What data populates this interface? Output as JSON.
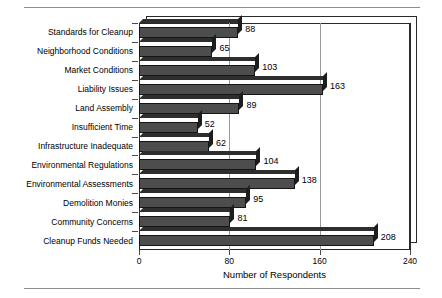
{
  "chart_data": {
    "type": "bar",
    "orientation": "horizontal",
    "title": "",
    "xlabel": "Number of Respondents",
    "ylabel": "",
    "xlim": [
      0,
      240
    ],
    "xticks": [
      0,
      80,
      160,
      240
    ],
    "grid": true,
    "legend": null,
    "categories": [
      "Standards for Cleanup",
      "Neighborhood Conditions",
      "Market Conditions",
      "Liability Issues",
      "Land Assembly",
      "Insufficient Time",
      "Infrastructure Inadequate",
      "Environmental Regulations",
      "Environmental Assessments",
      "Demolition Monies",
      "Community Concerns",
      "Cleanup Funds Needed"
    ],
    "values": [
      88,
      65,
      103,
      163,
      89,
      52,
      62,
      104,
      138,
      95,
      81,
      208
    ],
    "bar_color": "#4d4d4d",
    "data_labels": [
      "88",
      "65",
      "103",
      "163",
      "89",
      "52",
      "62",
      "104",
      "138",
      "95",
      "81",
      "208"
    ]
  },
  "axis": {
    "x_title": "Number of Respondents",
    "tick_labels": [
      "0",
      "80",
      "160",
      "240"
    ]
  }
}
